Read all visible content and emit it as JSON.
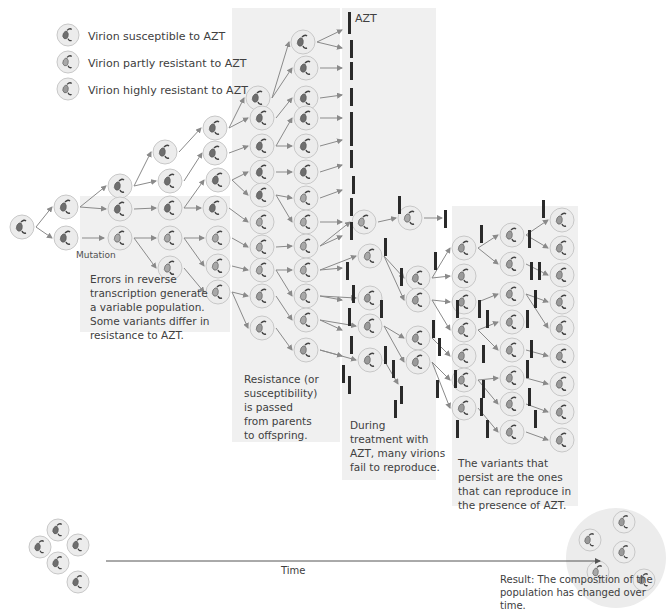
{
  "legend": {
    "items": [
      {
        "label": "Virion susceptible to AZT",
        "type": "susceptible"
      },
      {
        "label": "Virion partly resistant to AZT",
        "type": "partly"
      },
      {
        "label": "Virion highly resistant to AZT",
        "type": "highly"
      }
    ]
  },
  "labels": {
    "azt": "AZT",
    "mutation": "Mutation",
    "time": "Time"
  },
  "captions": {
    "errors": "Errors in reverse\ntranscription generate\na variable population.\nSome variants differ in\nresistance to AZT.",
    "resistance": "Resistance (or\nsusceptibility)\nis passed\nfrom parents\nto offspring.",
    "treatment": "During\ntreatment with\nAZT, many virions\nfail to reproduce.",
    "persist": "The variants that\npersist are the ones\nthat can reproduce in\nthe presence of AZT.",
    "result": "Result: The composition of the\npopulation has changed over time."
  },
  "colors": {
    "panel": "#f0f0f0",
    "virion_bg": "#ececec",
    "virion_ring": "#c8c8c8",
    "susceptible_fill": "#6e6e6e",
    "partly_fill": "#a8a8a8",
    "highly_fill": "#9a9a9a",
    "azt_bar": "#2a2a2a",
    "arrow": "#8a8a8a"
  }
}
